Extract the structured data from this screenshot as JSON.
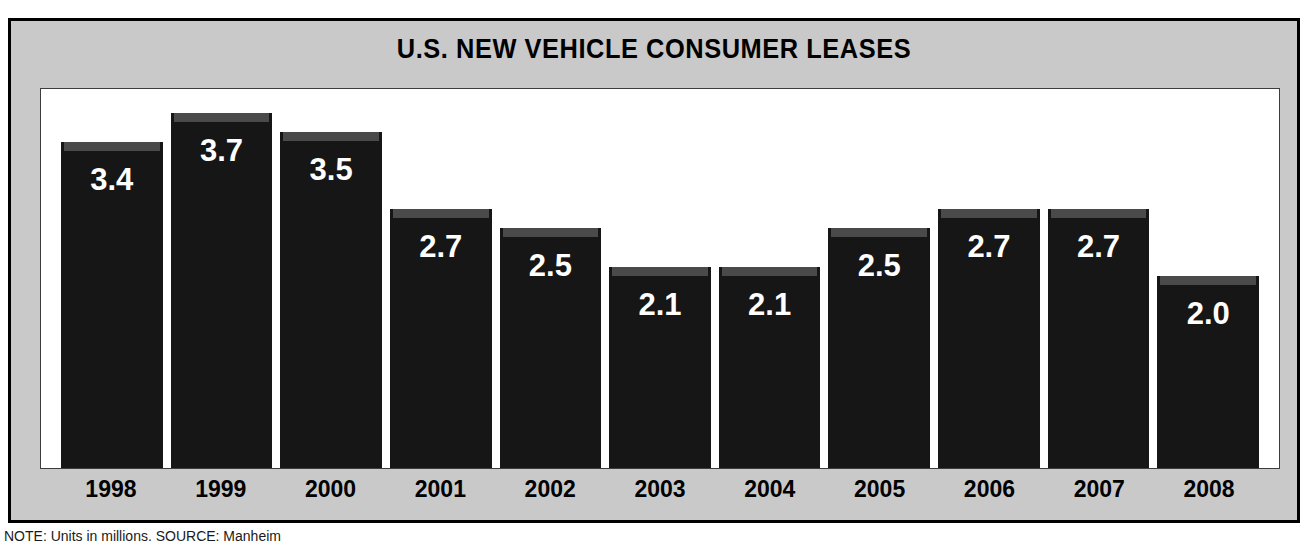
{
  "chart_data": {
    "type": "bar",
    "title": "U.S. NEW VEHICLE CONSUMER LEASES",
    "categories": [
      "1998",
      "1999",
      "2000",
      "2001",
      "2002",
      "2003",
      "2004",
      "2005",
      "2006",
      "2007",
      "2008"
    ],
    "values": [
      3.4,
      3.7,
      3.5,
      2.7,
      2.5,
      2.1,
      2.1,
      2.5,
      2.7,
      2.7,
      2.0
    ],
    "value_labels": [
      "3.4",
      "3.7",
      "3.5",
      "2.7",
      "2.5",
      "2.1",
      "2.1",
      "2.5",
      "2.7",
      "2.7",
      "2.0"
    ],
    "xlabel": "",
    "ylabel": "",
    "ylim": [
      0,
      3.95
    ],
    "grid": false,
    "legend": false,
    "bar_color": "#161616",
    "bar_top_color": "#4a4a4a",
    "value_label_color": "#ffffff",
    "panel_color": "#c9c9c9",
    "plot_background": "#ffffff",
    "units": "millions",
    "annotations": [
      "NOTE: Units in millions.  SOURCE: Manheim"
    ]
  },
  "footnote": {
    "text": "NOTE: Units in millions.  SOURCE: Manheim"
  }
}
